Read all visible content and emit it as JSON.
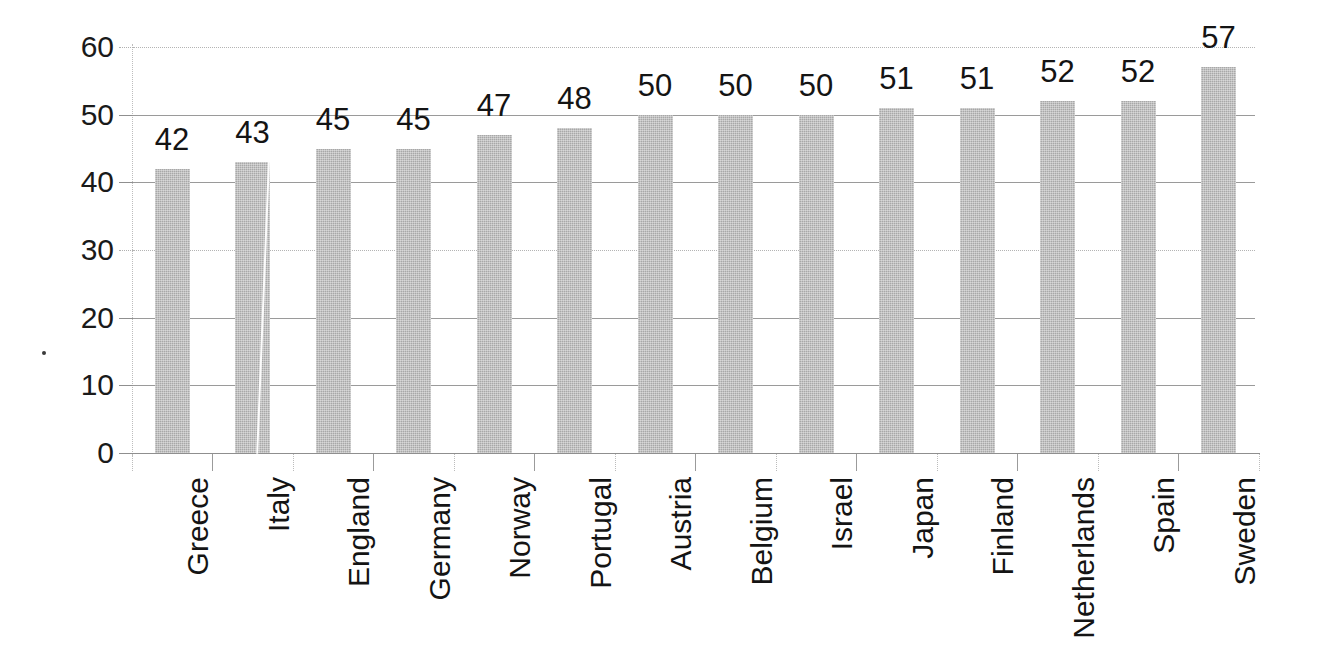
{
  "chart_data": {
    "type": "bar",
    "title": "",
    "subtitle": "",
    "xlabel": "",
    "ylabel": "",
    "ylim": [
      0,
      60
    ],
    "y_ticks": [
      0,
      10,
      20,
      30,
      40,
      50,
      60
    ],
    "y_tick_labels": [
      "0",
      "10",
      "20",
      "30",
      "40",
      "50",
      "60"
    ],
    "grid": true,
    "grid_axis": "y",
    "gridline_styles": {
      "60": "dotted",
      "50": "solid",
      "40": "solid",
      "30": "dotted",
      "20": "solid",
      "10": "solid",
      "0": "solid"
    },
    "legend": null,
    "legend_position": "none",
    "bar_color": "#a8a8a8",
    "bar_texture": "dithered-halftone-gray",
    "categories": [
      "Greece",
      "Italy",
      "England",
      "Germany",
      "Norway",
      "Portugal",
      "Austria",
      "Belgium",
      "Israel",
      "Japan",
      "Finland",
      "Netherlands",
      "Spain",
      "Sweden"
    ],
    "values": [
      42,
      43,
      45,
      45,
      47,
      48,
      50,
      50,
      50,
      51,
      51,
      52,
      52,
      57
    ],
    "value_labels": [
      "42",
      "43",
      "45",
      "45",
      "47",
      "48",
      "50",
      "50",
      "50",
      "51",
      "51",
      "52",
      "52",
      "57"
    ],
    "data_labels_shown": true,
    "annotations": []
  },
  "artifacts": {
    "scan_streak": "white-diagonal-line-through-italy-bar",
    "scan_speck": "small-dark-dot-left-margin"
  }
}
